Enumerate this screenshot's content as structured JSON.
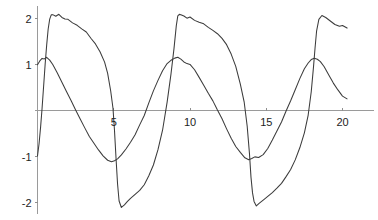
{
  "chart_data": {
    "type": "line",
    "title": "",
    "subtitle": "",
    "xlabel": "",
    "ylabel": "",
    "xlim": [
      0,
      20.5
    ],
    "ylim": [
      -2.3,
      2.25
    ],
    "grid": false,
    "legend": null,
    "legend_position": "none",
    "annotations": [],
    "x_ticks": [
      5,
      10,
      15,
      20
    ],
    "x_tick_labels": [
      "5",
      "10",
      "15",
      "20"
    ],
    "y_ticks": [
      2,
      1,
      -1,
      -2
    ],
    "y_tick_labels": [
      "2",
      "1",
      "-1",
      "-2"
    ],
    "axis_origin": [
      0,
      0
    ],
    "series": [
      {
        "name": "sawtooth-wave",
        "description": "steep rise to about 2.1 then slow noisy decay, sharp drop to about -2.1; period about 9",
        "color": "#3c3c3c",
        "x": [
          0.0,
          0.1,
          0.2,
          0.3,
          0.4,
          0.5,
          0.6,
          0.7,
          0.8,
          0.9,
          1.0,
          1.2,
          1.4,
          1.6,
          1.8,
          2.0,
          2.3,
          2.6,
          2.9,
          3.2,
          3.5,
          3.8,
          4.1,
          4.4,
          4.6,
          4.8,
          4.95,
          5.05,
          5.15,
          5.25,
          5.35,
          5.5,
          5.7,
          5.9,
          6.1,
          6.4,
          6.7,
          7.0,
          7.3,
          7.6,
          7.9,
          8.2,
          8.5,
          8.75,
          8.95,
          9.1,
          9.2,
          9.3,
          9.4,
          9.6,
          9.8,
          10.0,
          10.3,
          10.6,
          10.9,
          11.2,
          11.5,
          11.8,
          12.1,
          12.4,
          12.7,
          13.0,
          13.3,
          13.55,
          13.75,
          13.9,
          14.0,
          14.1,
          14.2,
          14.35,
          14.55,
          14.8,
          15.1,
          15.4,
          15.7,
          16.0,
          16.3,
          16.6,
          16.9,
          17.2,
          17.5,
          17.75,
          17.95,
          18.1,
          18.2,
          18.3,
          18.45,
          18.65,
          18.9,
          19.2,
          19.5,
          19.8,
          20.0,
          20.3
        ],
        "y": [
          -1.0,
          -0.72,
          -0.38,
          0.05,
          0.52,
          1.0,
          1.42,
          1.76,
          1.98,
          2.08,
          2.1,
          2.06,
          2.08,
          2.04,
          2.0,
          1.98,
          1.92,
          1.85,
          1.78,
          1.7,
          1.58,
          1.45,
          1.28,
          1.05,
          0.8,
          0.42,
          0.05,
          -0.45,
          -1.05,
          -1.6,
          -1.95,
          -2.1,
          -2.06,
          -1.98,
          -1.92,
          -1.82,
          -1.72,
          -1.6,
          -1.42,
          -1.18,
          -0.85,
          -0.42,
          0.18,
          0.78,
          1.35,
          1.85,
          2.05,
          2.09,
          2.07,
          2.04,
          2.0,
          2.02,
          1.97,
          1.92,
          1.88,
          1.82,
          1.74,
          1.66,
          1.56,
          1.42,
          1.22,
          0.95,
          0.58,
          0.18,
          -0.35,
          -0.95,
          -1.45,
          -1.8,
          -1.98,
          -2.08,
          -2.02,
          -1.95,
          -1.88,
          -1.8,
          -1.7,
          -1.58,
          -1.45,
          -1.28,
          -1.08,
          -0.82,
          -0.48,
          -0.1,
          0.4,
          0.95,
          1.35,
          1.72,
          1.98,
          2.06,
          2.02,
          1.96,
          1.88,
          1.82,
          1.85,
          1.8
        ]
      },
      {
        "name": "triangular-wave",
        "description": "smoother rounded wave peaking near 1.15 and troughing near -1.10; period about 9",
        "color": "#3c3c3c",
        "x": [
          0.0,
          0.15,
          0.3,
          0.45,
          0.6,
          0.8,
          1.0,
          1.3,
          1.6,
          1.9,
          2.2,
          2.5,
          2.8,
          3.1,
          3.4,
          3.7,
          4.0,
          4.3,
          4.6,
          4.85,
          5.05,
          5.25,
          5.5,
          5.8,
          6.1,
          6.4,
          6.7,
          7.0,
          7.3,
          7.6,
          7.9,
          8.2,
          8.5,
          8.75,
          9.0,
          9.2,
          9.4,
          9.6,
          9.8,
          10.0,
          10.3,
          10.6,
          10.9,
          11.2,
          11.5,
          11.8,
          12.1,
          12.4,
          12.7,
          13.0,
          13.3,
          13.6,
          13.85,
          14.05,
          14.25,
          14.5,
          14.8,
          15.1,
          15.4,
          15.7,
          16.0,
          16.3,
          16.6,
          16.9,
          17.2,
          17.5,
          17.75,
          17.95,
          18.15,
          18.35,
          18.55,
          18.8,
          19.1,
          19.4,
          19.7,
          20.0,
          20.3
        ],
        "y": [
          1.0,
          1.08,
          1.14,
          1.12,
          1.15,
          1.1,
          1.0,
          0.82,
          0.62,
          0.42,
          0.22,
          0.02,
          -0.18,
          -0.38,
          -0.56,
          -0.72,
          -0.86,
          -0.98,
          -1.08,
          -1.12,
          -1.1,
          -1.05,
          -0.96,
          -0.84,
          -0.7,
          -0.52,
          -0.32,
          -0.1,
          0.16,
          0.42,
          0.66,
          0.86,
          1.02,
          1.1,
          1.14,
          1.15,
          1.12,
          1.06,
          1.02,
          1.0,
          0.88,
          0.72,
          0.55,
          0.38,
          0.2,
          0.02,
          -0.18,
          -0.4,
          -0.6,
          -0.78,
          -0.92,
          -1.02,
          -1.06,
          -1.04,
          -1.0,
          -1.02,
          -0.95,
          -0.82,
          -0.64,
          -0.45,
          -0.25,
          -0.02,
          0.22,
          0.46,
          0.7,
          0.9,
          1.04,
          1.1,
          1.13,
          1.12,
          1.06,
          0.95,
          0.78,
          0.6,
          0.44,
          0.32,
          0.26
        ]
      }
    ]
  },
  "axes": {
    "x_axis_name": "horizontal-axis",
    "y_axis_name": "vertical-axis"
  }
}
